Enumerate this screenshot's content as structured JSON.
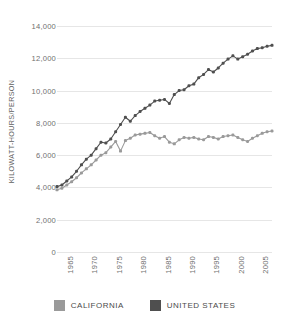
{
  "chart_data": {
    "type": "line",
    "title": "",
    "xlabel": "",
    "ylabel": "KILOWATT-HOURS/PERSON",
    "ylim": [
      0,
      14000
    ],
    "xlim": [
      1964,
      2008
    ],
    "grid": true,
    "legend_position": "bottom",
    "y_ticks": [
      {
        "value": 14000,
        "label": "14,000"
      },
      {
        "value": 12000,
        "label": "12,000"
      },
      {
        "value": 10000,
        "label": "10,000"
      },
      {
        "value": 8000,
        "label": "8,000"
      },
      {
        "value": 6000,
        "label": "6,000"
      },
      {
        "value": 4000,
        "label": "4,000"
      },
      {
        "value": 2000,
        "label": "2,000"
      },
      {
        "value": 0,
        "label": "0"
      }
    ],
    "x_ticks": [
      {
        "value": 1965,
        "label": "1965"
      },
      {
        "value": 1970,
        "label": "1970"
      },
      {
        "value": 1975,
        "label": "1975"
      },
      {
        "value": 1980,
        "label": "1980"
      },
      {
        "value": 1985,
        "label": "1985"
      },
      {
        "value": 1990,
        "label": "1990"
      },
      {
        "value": 1995,
        "label": "1995"
      },
      {
        "value": 2000,
        "label": "2000"
      },
      {
        "value": 2005,
        "label": "2005"
      }
    ],
    "x": [
      1964,
      1965,
      1966,
      1967,
      1968,
      1969,
      1970,
      1971,
      1972,
      1973,
      1974,
      1975,
      1976,
      1977,
      1978,
      1979,
      1980,
      1981,
      1982,
      1983,
      1984,
      1985,
      1986,
      1987,
      1988,
      1989,
      1990,
      1991,
      1992,
      1993,
      1994,
      1995,
      1996,
      1997,
      1998,
      1999,
      2000,
      2001,
      2002,
      2003,
      2004,
      2005,
      2006,
      2007,
      2008
    ],
    "series": [
      {
        "name": "CALIFORNIA",
        "color": "#9a9a9a",
        "values": [
          3850,
          3950,
          4150,
          4350,
          4600,
          4900,
          5150,
          5400,
          5700,
          6000,
          6150,
          6500,
          6850,
          6250,
          6900,
          7050,
          7250,
          7300,
          7350,
          7400,
          7200,
          7050,
          7150,
          6800,
          6700,
          6950,
          7100,
          7050,
          7100,
          7000,
          6950,
          7150,
          7100,
          7000,
          7150,
          7200,
          7250,
          7100,
          6950,
          6850,
          7050,
          7200,
          7350,
          7450,
          7500
        ]
      },
      {
        "name": "UNITED STATES",
        "color": "#4f4f4f",
        "values": [
          4050,
          4150,
          4400,
          4650,
          5000,
          5400,
          5750,
          6000,
          6400,
          6800,
          6750,
          7000,
          7450,
          7900,
          8350,
          8100,
          8450,
          8700,
          8900,
          9100,
          9350,
          9400,
          9450,
          9200,
          9750,
          10000,
          10050,
          10300,
          10400,
          10800,
          11000,
          11300,
          11150,
          11400,
          11700,
          11950,
          12150,
          11950,
          12100,
          12250,
          12450,
          12600,
          12650,
          12750,
          12800
        ]
      }
    ]
  },
  "legend": {
    "items": [
      {
        "label": "CALIFORNIA",
        "color": "#9a9a9a"
      },
      {
        "label": "UNITED STATES",
        "color": "#4f4f4f"
      }
    ]
  }
}
